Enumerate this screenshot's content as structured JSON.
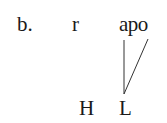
{
  "example_label": "b.",
  "segments": {
    "first": "r",
    "second": "apo"
  },
  "tones": {
    "high": "H",
    "low": "L"
  },
  "association_lines": [
    {
      "from": "a",
      "to": "L"
    },
    {
      "from": "o",
      "to": "L"
    }
  ],
  "colors": {
    "text": "#1a1a1a",
    "line": "#333333",
    "background": "#ffffff"
  }
}
